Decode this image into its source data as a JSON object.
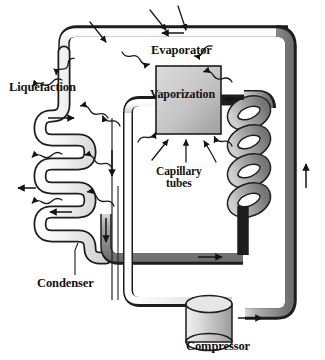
{
  "figure": {
    "kind": "refrigeration-cycle-diagram",
    "title": "",
    "background_color": "#ffffff",
    "outline_color": "#1a1a1a",
    "pipe_light_color": "#e8e8e8",
    "pipe_mid_color": "#b9b9b9",
    "pipe_dark_color": "#8f8f8f",
    "box_fill_color": "#c9c9c9",
    "text_color": "#121212"
  },
  "labels": {
    "liquefaction": "Liquefaction",
    "evaporator": "Evaporator",
    "vaporization": "Vaporization",
    "capillary_tubes": "Capillary\ntubes",
    "condenser": "Condenser",
    "compressor": "Compressor"
  },
  "components": [
    {
      "name": "condenser",
      "label": "Condenser",
      "shape": "serpentine-coil",
      "side": "left",
      "fill": "#eeeeee"
    },
    {
      "name": "evaporator",
      "label": "Evaporator",
      "shape": "rectangle-box",
      "fill": "#c9c9c9"
    },
    {
      "name": "evaporator-coil",
      "label": "",
      "shape": "helical-coil",
      "side": "right",
      "fill": "#a8a8a8"
    },
    {
      "name": "capillary-tubes",
      "label": "Capillary tubes",
      "shape": "thin-parallel-tubes"
    },
    {
      "name": "compressor",
      "label": "Compressor",
      "shape": "cylinder",
      "fill": "#d0d0d0"
    }
  ],
  "flow_arrows": [
    {
      "id": "top-pipe",
      "direction": "left"
    },
    {
      "id": "condenser-upper",
      "direction": "right"
    },
    {
      "id": "condenser-mid",
      "direction": "left"
    },
    {
      "id": "condenser-lower",
      "direction": "left"
    },
    {
      "id": "capillary-down",
      "direction": "down"
    },
    {
      "id": "condenser-outlet-down",
      "direction": "down"
    },
    {
      "id": "evaporator-inlet",
      "direction": "left"
    },
    {
      "id": "bottom-inner",
      "direction": "right"
    },
    {
      "id": "compressor-outlet",
      "direction": "right"
    },
    {
      "id": "right-riser",
      "direction": "up"
    }
  ],
  "heat_arrows": {
    "outgoing_label": "heat released at condenser",
    "incoming_label": "heat absorbed at evaporator",
    "style": "squiggly-wave-arrow"
  }
}
